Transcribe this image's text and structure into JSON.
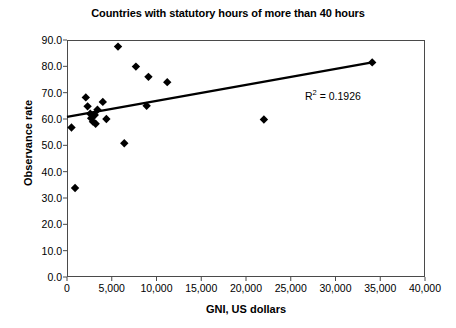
{
  "chart_data": {
    "type": "scatter",
    "title": "Countries with statutory hours of more than 40 hours",
    "xlabel": "GNI, US dollars",
    "ylabel": "Observance rate",
    "xlim": [
      0,
      40000
    ],
    "ylim": [
      0,
      90
    ],
    "grid": false,
    "legend": null,
    "xticks": [
      0,
      5000,
      10000,
      15000,
      20000,
      25000,
      30000,
      35000,
      40000
    ],
    "xtick_labels": [
      "0",
      "5,000",
      "10,000",
      "15,000",
      "20,000",
      "25,000",
      "30,000",
      "35,000",
      "40,000"
    ],
    "yticks": [
      0,
      10,
      20,
      30,
      40,
      50,
      60,
      70,
      80,
      90
    ],
    "ytick_labels": [
      "0.0",
      "10.0",
      "20.0",
      "30.0",
      "40.0",
      "50.0",
      "60.0",
      "70.0",
      "80.0",
      "90.0"
    ],
    "marker": "diamond",
    "marker_color": "#000000",
    "points": [
      {
        "x": 500,
        "y": 56.8
      },
      {
        "x": 900,
        "y": 33.8
      },
      {
        "x": 2100,
        "y": 68.2
      },
      {
        "x": 2300,
        "y": 64.8
      },
      {
        "x": 2600,
        "y": 62.0
      },
      {
        "x": 2700,
        "y": 60.3
      },
      {
        "x": 2900,
        "y": 59.0
      },
      {
        "x": 3100,
        "y": 61.5
      },
      {
        "x": 3200,
        "y": 58.2
      },
      {
        "x": 3400,
        "y": 63.5
      },
      {
        "x": 4000,
        "y": 66.5
      },
      {
        "x": 4400,
        "y": 60.0
      },
      {
        "x": 5700,
        "y": 87.5
      },
      {
        "x": 6400,
        "y": 50.8
      },
      {
        "x": 7700,
        "y": 79.9
      },
      {
        "x": 8900,
        "y": 65.0
      },
      {
        "x": 9100,
        "y": 76.0
      },
      {
        "x": 11200,
        "y": 74.0
      },
      {
        "x": 22000,
        "y": 59.8
      },
      {
        "x": 34100,
        "y": 81.5
      }
    ],
    "trendline": {
      "type": "linear",
      "x_start": 0,
      "y_start": 60.8,
      "x_end": 34100,
      "y_end": 81.5,
      "color": "#000000",
      "width": 2.4
    },
    "annotation": {
      "r_squared_prefix": "R",
      "r_squared_exponent": "2",
      "r_squared_value": "= 0.1926"
    }
  }
}
